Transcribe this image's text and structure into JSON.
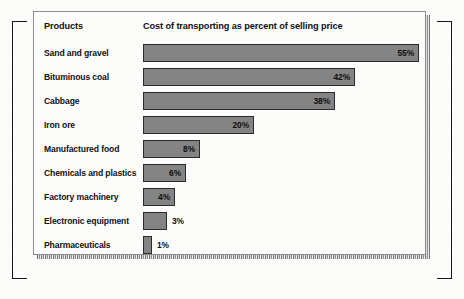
{
  "header": {
    "category_column": "Products",
    "value_column": "Cost of transporting as percent of selling price"
  },
  "colors": {
    "bar_fill": "#848484",
    "bar_outline": "#2c2c2c",
    "card_background": "#fdfdfb",
    "card_border": "#8d8d8d",
    "page_background": "#fdfdfc",
    "text": "#111111",
    "bracket": "#161616"
  },
  "chart_data": {
    "type": "bar",
    "orientation": "horizontal",
    "title": "Cost of transporting as percent of selling price",
    "xlabel": "",
    "ylabel": "Products",
    "categories": [
      "Sand and gravel",
      "Bituminous coal",
      "Cabbage",
      "Iron ore",
      "Manufactured food",
      "Chemicals and plastics",
      "Factory machinery",
      "Electronic equipment",
      "Pharmaceuticals"
    ],
    "values": [
      55,
      42,
      38,
      20,
      8,
      6,
      4,
      3,
      1
    ],
    "value_labels": [
      "55%",
      "42%",
      "38%",
      "20%",
      "8%",
      "6%",
      "4%",
      "3%",
      "1%"
    ],
    "label_position": [
      "inside",
      "inside",
      "inside",
      "inside",
      "inside",
      "inside",
      "inside",
      "outside",
      "outside"
    ],
    "bar_pixel_widths": [
      276,
      212,
      192,
      111,
      57,
      43,
      32,
      24,
      9
    ],
    "xlim": [
      0,
      55
    ],
    "grid": false,
    "legend": null
  },
  "rows": [
    {
      "label": "Sand and gravel",
      "value": 55,
      "value_label": "55%",
      "width_px": 276,
      "label_position": "inside"
    },
    {
      "label": "Bituminous coal",
      "value": 42,
      "value_label": "42%",
      "width_px": 212,
      "label_position": "inside"
    },
    {
      "label": "Cabbage",
      "value": 38,
      "value_label": "38%",
      "width_px": 192,
      "label_position": "inside"
    },
    {
      "label": "Iron ore",
      "value": 20,
      "value_label": "20%",
      "width_px": 111,
      "label_position": "inside"
    },
    {
      "label": "Manufactured food",
      "value": 8,
      "value_label": "8%",
      "width_px": 57,
      "label_position": "inside"
    },
    {
      "label": "Chemicals and plastics",
      "value": 6,
      "value_label": "6%",
      "width_px": 43,
      "label_position": "inside"
    },
    {
      "label": "Factory machinery",
      "value": 4,
      "value_label": "4%",
      "width_px": 32,
      "label_position": "inside"
    },
    {
      "label": "Electronic equipment",
      "value": 3,
      "value_label": "3%",
      "width_px": 24,
      "label_position": "outside"
    },
    {
      "label": "Pharmaceuticals",
      "value": 1,
      "value_label": "1%",
      "width_px": 9,
      "label_position": "outside"
    }
  ]
}
